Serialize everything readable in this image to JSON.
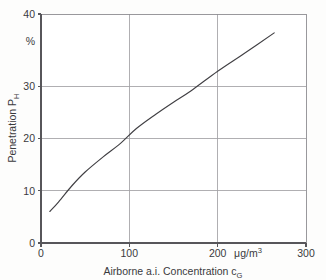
{
  "figure": {
    "background_color": "#fdfdfc",
    "line_color": "#403f43",
    "grid_color": "#a2a1a5",
    "axis_color": "#57565a"
  },
  "axes": {
    "y": {
      "title_main": "Penetration P",
      "title_sub": "H",
      "unit": "%",
      "tick_labels": [
        "0",
        "10",
        "20",
        "30",
        "40"
      ],
      "tick_values": [
        0,
        10,
        20,
        30,
        40
      ],
      "min": 0,
      "max": 40
    },
    "x": {
      "title_main": "Airborne a.i. Concentration c",
      "title_sub": "G",
      "unit_main": "μg/m",
      "unit_sup": "3",
      "tick_labels": [
        "0",
        "100",
        "200",
        "300"
      ],
      "tick_values": [
        0,
        100,
        200,
        300
      ],
      "min": 0,
      "max": 300
    }
  },
  "chart_data": {
    "type": "line",
    "title": "",
    "xlabel": "Airborne a.i. Concentration cG (μg/m3)",
    "ylabel": "Penetration PH (%)",
    "xlim": [
      0,
      300
    ],
    "ylim": [
      0,
      40
    ],
    "xticks": [
      0,
      100,
      200,
      300
    ],
    "yticks": [
      0,
      10,
      20,
      30,
      40
    ],
    "grid": true,
    "legend": "none",
    "series": [
      {
        "name": "Penetration vs airborne a.i. concentration",
        "x": [
          10,
          20,
          35,
          50,
          70,
          90,
          108,
          130,
          150,
          170,
          200,
          230,
          264
        ],
        "y": [
          5.5,
          7.2,
          10.0,
          12.4,
          15.0,
          17.4,
          20.0,
          22.5,
          24.6,
          26.6,
          30.0,
          33.1,
          36.7
        ]
      }
    ],
    "annotations": [
      "Curve is slightly concave-down, rising monotonically across the full range",
      "Curve passes through (200, 30) at the gridline intersection"
    ]
  }
}
